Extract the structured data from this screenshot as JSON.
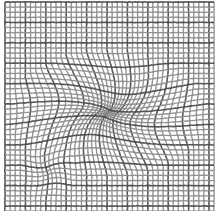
{
  "image": {
    "title": "Warped grid mesh distortion",
    "width": 217,
    "height": 211,
    "background_color": "#ffffff"
  },
  "canvas": {
    "name": "mesh-canvas",
    "plot_area": {
      "x": 5,
      "y": 2,
      "width": 209,
      "height": 209
    }
  },
  "grid": {
    "type": "warped-rectangular-mesh",
    "spacing_px": 5.1,
    "line_color": "#8a8a8a",
    "line_color_dark": "#4a4a4a",
    "line_width": 1.35,
    "line_width_dark": 1.6,
    "opacity": 0.92,
    "samples_per_line": 170,
    "cols": 42,
    "rows": 42,
    "dark_line_every": 4
  },
  "distortions": [
    {
      "name": "primary-pinch",
      "kind": "pinch",
      "center_x": 108,
      "center_y": 113,
      "radius": 86,
      "strength": 0.82,
      "swirl": 0.34,
      "squeeze_x": 1.18,
      "squeeze_y": 0.74
    },
    {
      "name": "secondary-pinch",
      "kind": "pinch",
      "center_x": 49,
      "center_y": 170,
      "radius": 30,
      "strength": 0.34,
      "swirl": -0.22,
      "squeeze_x": 0.95,
      "squeeze_y": 1.05
    }
  ],
  "noise": {
    "jitter_px": 0.22,
    "seed": 20394
  }
}
